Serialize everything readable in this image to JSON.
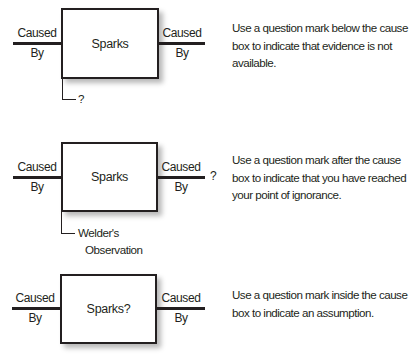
{
  "diagrams": [
    {
      "box_label": "Sparks",
      "left_connector": {
        "top": "Caused",
        "bottom": "By"
      },
      "right_connector": {
        "top": "Caused",
        "bottom": "By"
      },
      "below_note": "?",
      "description": "Use a question mark below the cause box to indicate that evidence is not available."
    },
    {
      "box_label": "Sparks",
      "left_connector": {
        "top": "Caused",
        "bottom": "By"
      },
      "right_connector": {
        "top": "Caused",
        "bottom": "By"
      },
      "after_mark": "?",
      "below_note_line1": "Welder's",
      "below_note_line2": "Observation",
      "description": "Use a question mark after the cause box to indicate that you have reached your point of ignorance."
    },
    {
      "box_label": "Sparks?",
      "left_connector": {
        "top": "Caused",
        "bottom": "By"
      },
      "right_connector": {
        "top": "Caused",
        "bottom": "By"
      },
      "description": "Use a question mark inside the cause box to indicate an assumption."
    }
  ]
}
